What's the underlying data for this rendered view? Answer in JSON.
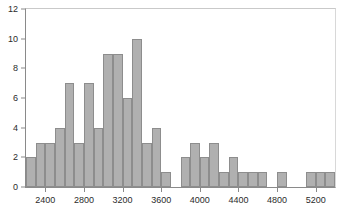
{
  "chart_data": {
    "type": "bar",
    "title": "",
    "subtitle": "",
    "xlabel": "",
    "ylabel": "",
    "xlim": [
      2200,
      5400
    ],
    "ylim": [
      0,
      12
    ],
    "grid": false,
    "legend": null,
    "bin_width": 100,
    "y_ticks": [
      0,
      2,
      4,
      6,
      8,
      10,
      12
    ],
    "y_tick_labels": [
      "0",
      "2",
      "4",
      "6",
      "8",
      "10",
      "12"
    ],
    "x_ticks": [
      2400,
      2800,
      3200,
      3600,
      4000,
      4400,
      4800,
      5200
    ],
    "x_tick_labels": [
      "2400",
      "2800",
      "3200",
      "3600",
      "4000",
      "4400",
      "4800",
      "5200"
    ],
    "bin_starts": [
      2200,
      2300,
      2400,
      2500,
      2600,
      2700,
      2800,
      2900,
      3000,
      3100,
      3200,
      3300,
      3400,
      3500,
      3600,
      3700,
      3800,
      3900,
      4000,
      4100,
      4200,
      4300,
      4400,
      4500,
      4600,
      4700,
      4800,
      4900,
      5000,
      5100,
      5200,
      5300
    ],
    "categories": [
      "2200-2300",
      "2300-2400",
      "2400-2500",
      "2500-2600",
      "2600-2700",
      "2700-2800",
      "2800-2900",
      "2900-3000",
      "3000-3100",
      "3100-3200",
      "3200-3300",
      "3300-3400",
      "3400-3500",
      "3500-3600",
      "3600-3700",
      "3700-3800",
      "3800-3900",
      "3900-4000",
      "4000-4100",
      "4100-4200",
      "4200-4300",
      "4300-4400",
      "4400-4500",
      "4500-4600",
      "4600-4700",
      "4700-4800",
      "4800-4900",
      "4900-5000",
      "5000-5100",
      "5100-5200",
      "5200-5300",
      "5300-5400"
    ],
    "values": [
      2,
      3,
      3,
      4,
      7,
      3,
      7,
      4,
      9,
      9,
      6,
      10,
      3,
      4,
      1,
      0,
      2,
      3,
      2,
      3,
      1,
      2,
      1,
      1,
      1,
      0,
      1,
      0,
      0,
      1,
      1,
      1
    ],
    "bar_color": "#b0b0b0",
    "bar_edge_color": "#8d8d8d",
    "axis_color": "#8a8a8a",
    "text_color": "#2b2b2b",
    "background_color": "#ffffff"
  }
}
